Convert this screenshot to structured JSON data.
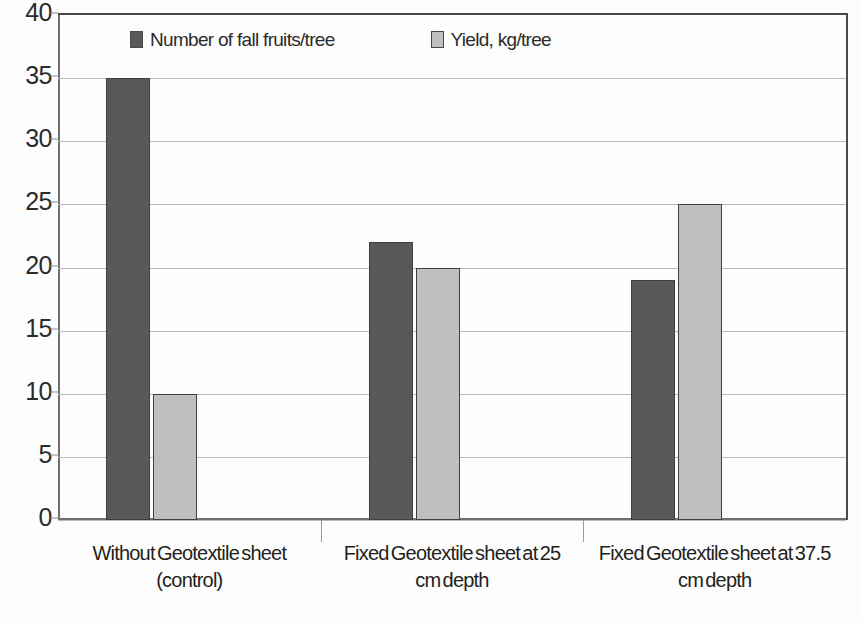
{
  "chart_data": {
    "type": "bar",
    "title": "",
    "subtitle": "",
    "xlabel": "",
    "ylabel": "",
    "ylim": [
      0,
      40
    ],
    "ytick_step": 5,
    "yticks": [
      40,
      35,
      30,
      25,
      20,
      15,
      10,
      5,
      0
    ],
    "ytick_labels": [
      "40",
      "35",
      "30",
      "25",
      "20",
      "15",
      "10",
      "5",
      "0"
    ],
    "grid": true,
    "grid_axis": "y",
    "legend_position": "top-inside",
    "categories": [
      "Without Geotextile sheet (control)",
      "Fixed Geotextile sheet at 25 cm depth",
      "Fixed Geotextile sheet at 37.5 cm depth"
    ],
    "category_lines": [
      [
        "Without Geotextile sheet",
        "(control)"
      ],
      [
        "Fixed Geotextile sheet at 25",
        "cm depth"
      ],
      [
        "Fixed Geotextile sheet at 37.5",
        "cm depth"
      ]
    ],
    "series": [
      {
        "name": "Number of fall fruits/tree",
        "color": "#595959",
        "values": [
          35,
          22,
          19
        ]
      },
      {
        "name": "Yield, kg/tree",
        "color": "#bfbfbf",
        "values": [
          10,
          20,
          25
        ]
      }
    ]
  },
  "legend": {
    "items": [
      {
        "label": "Number of fall fruits/tree",
        "color": "#595959"
      },
      {
        "label": "Yield, kg/tree",
        "color": "#bfbfbf"
      }
    ]
  },
  "axes": {
    "y_tick_labels": [
      "40",
      "35",
      "30",
      "25",
      "20",
      "15",
      "10",
      "5",
      "0"
    ]
  },
  "colors": {
    "series_dark": "#595959",
    "series_light": "#bfbfbf",
    "gridline": "#b9b9b9",
    "axis": "#6e6e6e",
    "text": "#231f20",
    "background": "#ffffff"
  }
}
